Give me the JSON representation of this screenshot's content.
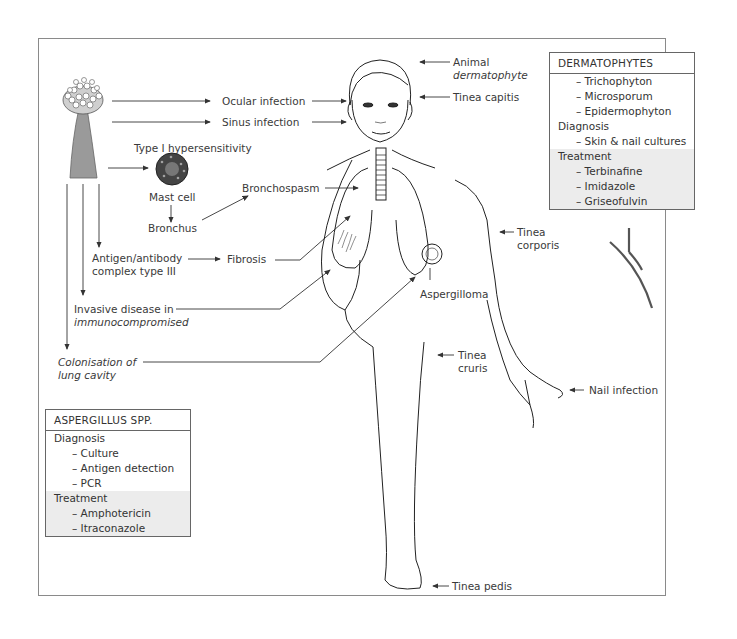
{
  "diagram": {
    "type": "infographic"
  },
  "aspergillus_labels": {
    "ocular": "Ocular infection",
    "sinus": "Sinus infection",
    "hypersensitivity": "Type I hypersensitivity",
    "mast_cell": "Mast cell",
    "bronchus": "Bronchus",
    "bronchospasm": "Bronchospasm",
    "antigen_line1": "Antigen/antibody",
    "antigen_line2": "complex type III",
    "fibrosis": "Fibrosis",
    "invasive_line1": "Invasive disease in",
    "invasive_line2": "immunocompromised",
    "colonisation_line1": "Colonisation of",
    "colonisation_line2": "lung cavity",
    "aspergilloma": "Aspergilloma"
  },
  "dermatophyte_labels": {
    "animal_line1": "Animal",
    "animal_line2": "dermatophyte",
    "capitis": "Tinea capitis",
    "corporis_line1": "Tinea",
    "corporis_line2": "corporis",
    "cruris_line1": "Tinea",
    "cruris_line2": "cruris",
    "nail": "Nail infection",
    "pedis": "Tinea pedis"
  },
  "dermatophytes_box": {
    "title": "DERMATOPHYTES",
    "species": [
      "– Trichophyton",
      "– Microsporum",
      "– Epidermophyton"
    ],
    "diagnosis_label": "Diagnosis",
    "diagnosis": [
      "– Skin & nail cultures"
    ],
    "treatment_label": "Treatment",
    "treatment": [
      "– Terbinafine",
      "– Imidazole",
      "– Griseofulvin"
    ]
  },
  "aspergillus_box": {
    "title": "ASPERGILLUS SPP.",
    "diagnosis_label": "Diagnosis",
    "diagnosis": [
      "– Culture",
      "– Antigen detection",
      "– PCR"
    ],
    "treatment_label": "Treatment",
    "treatment": [
      "– Amphotericin",
      "– Itraconazole"
    ]
  },
  "colors": {
    "line": "#333333",
    "frame": "#8a8a8a",
    "shade": "#ececec",
    "conidiophore": "#9a9a9a"
  }
}
